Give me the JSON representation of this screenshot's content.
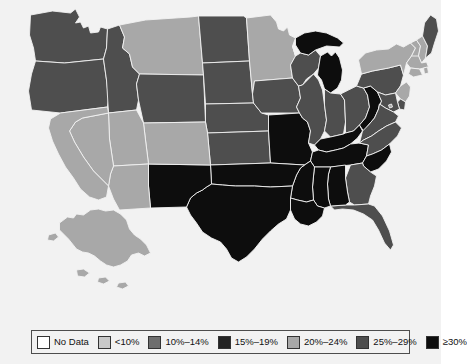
{
  "figure": {
    "background_color": "#f2f2f2",
    "border_color": "#f2f2f2"
  },
  "legend": {
    "name": "choropleth-legend",
    "border_color": "#4d4d4d",
    "items": [
      {
        "label": "No Data",
        "color": "#ffffff"
      },
      {
        "label": "<10%",
        "color": "#c8c8c8"
      },
      {
        "label": "10%–14%",
        "color": "#6e6e6e"
      },
      {
        "label": "15%–19%",
        "color": "#232323"
      },
      {
        "label": "20%–24%",
        "color": "#a8a8a8"
      },
      {
        "label": "25%–29%",
        "color": "#4e4e4e"
      },
      {
        "label": "≥30%",
        "color": "#0d0d0d"
      }
    ]
  },
  "chart_data": {
    "type": "choropleth",
    "title": "",
    "region": "United States",
    "value_label": "Percent",
    "bins": [
      {
        "label": "No Data",
        "color": "#ffffff",
        "min": null,
        "max": null
      },
      {
        "label": "<10%",
        "color": "#c8c8c8",
        "min": 0,
        "max": 9.9
      },
      {
        "label": "10%–14%",
        "color": "#6e6e6e",
        "min": 10,
        "max": 14.9
      },
      {
        "label": "15%–19%",
        "color": "#232323",
        "min": 15,
        "max": 19.9
      },
      {
        "label": "20%–24%",
        "color": "#a8a8a8",
        "min": 20,
        "max": 24.9
      },
      {
        "label": "25%–29%",
        "color": "#4e4e4e",
        "min": 25,
        "max": 29.9
      },
      {
        "label": "≥30%",
        "color": "#0d0d0d",
        "min": 30,
        "max": null
      }
    ],
    "states": {
      "AL": {
        "name": "Alabama",
        "bin": "≥30%",
        "color": "#0d0d0d"
      },
      "AK": {
        "name": "Alaska",
        "bin": "20%–24%",
        "color": "#a8a8a8"
      },
      "AZ": {
        "name": "Arizona",
        "bin": "20%–24%",
        "color": "#a8a8a8"
      },
      "AR": {
        "name": "Arkansas",
        "bin": "≥30%",
        "color": "#0d0d0d"
      },
      "CA": {
        "name": "California",
        "bin": "20%–24%",
        "color": "#a8a8a8"
      },
      "CO": {
        "name": "Colorado",
        "bin": "20%–24%",
        "color": "#a8a8a8"
      },
      "CT": {
        "name": "Connecticut",
        "bin": "20%–24%",
        "color": "#a8a8a8"
      },
      "DE": {
        "name": "Delaware",
        "bin": "25%–29%",
        "color": "#4e4e4e"
      },
      "DC": {
        "name": "District of Columbia",
        "bin": "20%–24%",
        "color": "#a8a8a8"
      },
      "FL": {
        "name": "Florida",
        "bin": "25%–29%",
        "color": "#4e4e4e"
      },
      "GA": {
        "name": "Georgia",
        "bin": "25%–29%",
        "color": "#4e4e4e"
      },
      "HI": {
        "name": "Hawaii",
        "bin": "No Data",
        "color": "#ffffff"
      },
      "ID": {
        "name": "Idaho",
        "bin": "25%–29%",
        "color": "#4e4e4e"
      },
      "IL": {
        "name": "Illinois",
        "bin": "25%–29%",
        "color": "#4e4e4e"
      },
      "IN": {
        "name": "Indiana",
        "bin": "25%–29%",
        "color": "#4e4e4e"
      },
      "IA": {
        "name": "Iowa",
        "bin": "25%–29%",
        "color": "#4e4e4e"
      },
      "KS": {
        "name": "Kansas",
        "bin": "25%–29%",
        "color": "#4e4e4e"
      },
      "KY": {
        "name": "Kentucky",
        "bin": "≥30%",
        "color": "#0d0d0d"
      },
      "LA": {
        "name": "Louisiana",
        "bin": "≥30%",
        "color": "#0d0d0d"
      },
      "ME": {
        "name": "Maine",
        "bin": "25%–29%",
        "color": "#4e4e4e"
      },
      "MD": {
        "name": "Maryland",
        "bin": "25%–29%",
        "color": "#4e4e4e"
      },
      "MA": {
        "name": "Massachusetts",
        "bin": "20%–24%",
        "color": "#a8a8a8"
      },
      "MI": {
        "name": "Michigan",
        "bin": "≥30%",
        "color": "#0d0d0d"
      },
      "MN": {
        "name": "Minnesota",
        "bin": "20%–24%",
        "color": "#a8a8a8"
      },
      "MS": {
        "name": "Mississippi",
        "bin": "≥30%",
        "color": "#0d0d0d"
      },
      "MO": {
        "name": "Missouri",
        "bin": "≥30%",
        "color": "#0d0d0d"
      },
      "MT": {
        "name": "Montana",
        "bin": "20%–24%",
        "color": "#a8a8a8"
      },
      "NE": {
        "name": "Nebraska",
        "bin": "25%–29%",
        "color": "#4e4e4e"
      },
      "NV": {
        "name": "Nevada",
        "bin": "20%–24%",
        "color": "#a8a8a8"
      },
      "NH": {
        "name": "New Hampshire",
        "bin": "20%–24%",
        "color": "#a8a8a8"
      },
      "NJ": {
        "name": "New Jersey",
        "bin": "20%–24%",
        "color": "#a8a8a8"
      },
      "NM": {
        "name": "New Mexico",
        "bin": "≥30%",
        "color": "#0d0d0d"
      },
      "NY": {
        "name": "New York",
        "bin": "20%–24%",
        "color": "#a8a8a8"
      },
      "NC": {
        "name": "North Carolina",
        "bin": "25%–29%",
        "color": "#4e4e4e"
      },
      "ND": {
        "name": "North Dakota",
        "bin": "25%–29%",
        "color": "#4e4e4e"
      },
      "OH": {
        "name": "Ohio",
        "bin": "25%–29%",
        "color": "#4e4e4e"
      },
      "OK": {
        "name": "Oklahoma",
        "bin": "≥30%",
        "color": "#0d0d0d"
      },
      "OR": {
        "name": "Oregon",
        "bin": "25%–29%",
        "color": "#4e4e4e"
      },
      "PA": {
        "name": "Pennsylvania",
        "bin": "25%–29%",
        "color": "#4e4e4e"
      },
      "RI": {
        "name": "Rhode Island",
        "bin": "20%–24%",
        "color": "#a8a8a8"
      },
      "SC": {
        "name": "South Carolina",
        "bin": "≥30%",
        "color": "#0d0d0d"
      },
      "SD": {
        "name": "South Dakota",
        "bin": "25%–29%",
        "color": "#4e4e4e"
      },
      "TN": {
        "name": "Tennessee",
        "bin": "≥30%",
        "color": "#0d0d0d"
      },
      "TX": {
        "name": "Texas",
        "bin": "≥30%",
        "color": "#0d0d0d"
      },
      "UT": {
        "name": "Utah",
        "bin": "20%–24%",
        "color": "#a8a8a8"
      },
      "VT": {
        "name": "Vermont",
        "bin": "20%–24%",
        "color": "#a8a8a8"
      },
      "VA": {
        "name": "Virginia",
        "bin": "25%–29%",
        "color": "#4e4e4e"
      },
      "WA": {
        "name": "Washington",
        "bin": "25%–29%",
        "color": "#4e4e4e"
      },
      "WV": {
        "name": "West Virginia",
        "bin": "≥30%",
        "color": "#0d0d0d"
      },
      "WI": {
        "name": "Wisconsin",
        "bin": "25%–29%",
        "color": "#4e4e4e"
      },
      "WY": {
        "name": "Wyoming",
        "bin": "25%–29%",
        "color": "#4e4e4e"
      }
    }
  }
}
